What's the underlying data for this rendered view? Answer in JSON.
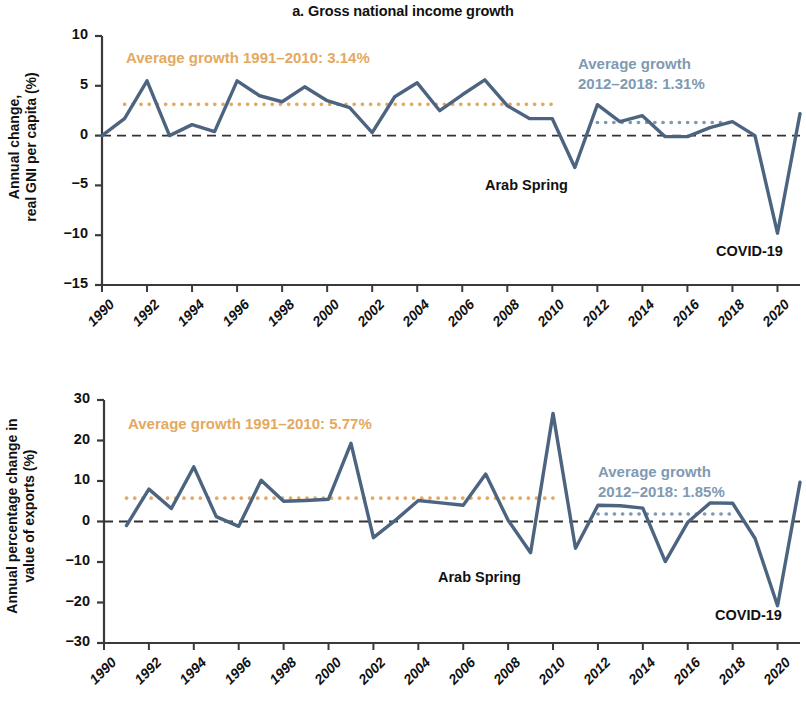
{
  "figure": {
    "background": "#ffffff",
    "series_color": "#4c6480",
    "orange_color": "#e5a860",
    "blue_color": "#7e9ab3",
    "zero_line_color": "#333333",
    "axis_color": "#3a3a3a"
  },
  "panel_a": {
    "title": "a. Gross national income growth",
    "ylabel_line1": "Annual change,",
    "ylabel_line2": "real GNI per capita (%)",
    "avg_note_orange": "Average growth 1991–2010: 3.14%",
    "avg_note_blue_line1": "Average growth",
    "avg_note_blue_line2": "2012–2018: 1.31%",
    "annotation_arab_spring": "Arab Spring",
    "annotation_covid": "COVID-19"
  },
  "panel_b": {
    "title": "b. Export growth",
    "ylabel_line1": "Annual percentage change in",
    "ylabel_line2": "value of exports (%)",
    "avg_note_orange": "Average growth 1991–2010: 5.77%",
    "avg_note_blue_line1": "Average growth",
    "avg_note_blue_line2": "2012–2018: 1.85%",
    "annotation_arab_spring": "Arab Spring",
    "annotation_covid": "COVID-19"
  },
  "chart_data": [
    {
      "type": "line",
      "id": "panel_a",
      "title": "a. Gross national income growth",
      "xlabel": "",
      "ylabel": "Annual change, real GNI per capita (%)",
      "xlim": [
        1990,
        2021
      ],
      "ylim": [
        -15,
        10
      ],
      "yticks": [
        10,
        5,
        0,
        -5,
        -10,
        -15
      ],
      "ytick_labels": [
        "10",
        "5",
        "0",
        "−5",
        "−10",
        "−15"
      ],
      "xticks": [
        1990,
        1992,
        1994,
        1996,
        1998,
        2000,
        2002,
        2004,
        2006,
        2008,
        2010,
        2012,
        2014,
        2016,
        2018,
        2020
      ],
      "xtick_labels": [
        "1990",
        "1992",
        "1994",
        "1996",
        "1998",
        "2000",
        "2002",
        "2004",
        "2006",
        "2008",
        "2010",
        "2012",
        "2014",
        "2016",
        "2018",
        "2020"
      ],
      "grid": false,
      "legend": "none",
      "x": [
        1990,
        1991,
        1992,
        1993,
        1994,
        1995,
        1996,
        1997,
        1998,
        1999,
        2000,
        2001,
        2002,
        2003,
        2004,
        2005,
        2006,
        2007,
        2008,
        2009,
        2010,
        2011,
        2012,
        2013,
        2014,
        2015,
        2016,
        2017,
        2018,
        2019,
        2020,
        2021
      ],
      "series": [
        {
          "name": "Annual change, real GNI per capita (%)",
          "color": "#4c6480",
          "values": [
            0.0,
            1.7,
            5.5,
            0.0,
            1.1,
            0.4,
            5.5,
            4.0,
            3.4,
            4.9,
            3.5,
            2.8,
            0.3,
            3.9,
            5.3,
            2.5,
            4.1,
            5.6,
            3.0,
            1.7,
            1.7,
            -3.2,
            3.1,
            1.4,
            2.0,
            -0.1,
            -0.1,
            0.8,
            1.4,
            0.0,
            -9.8,
            2.2
          ]
        }
      ],
      "reference_lines": [
        {
          "name": "Average growth 1991–2010",
          "value": 3.14,
          "label": "Average growth 1991–2010: 3.14%",
          "color": "#e5a860",
          "style": "dotted",
          "x_start": 1991,
          "x_end": 2010
        },
        {
          "name": "Average growth 2012–2018",
          "value": 1.31,
          "label": "Average growth 2012–2018: 1.31%",
          "color": "#7e9ab3",
          "style": "dotted",
          "x_start": 2012,
          "x_end": 2018
        },
        {
          "name": "zero",
          "value": 0,
          "label": "",
          "color": "#333333",
          "style": "dashed",
          "x_start": 1990,
          "x_end": 2021
        }
      ],
      "annotations": [
        {
          "text": "Arab Spring",
          "x": 2011,
          "y": -4.6
        },
        {
          "text": "COVID-19",
          "x": 2020,
          "y": -12.0
        }
      ]
    },
    {
      "type": "line",
      "id": "panel_b",
      "title": "b. Export growth",
      "xlabel": "",
      "ylabel": "Annual percentage change in value of exports (%)",
      "xlim": [
        1990,
        2021
      ],
      "ylim": [
        -30,
        30
      ],
      "yticks": [
        30,
        20,
        10,
        0,
        -10,
        -20,
        -30
      ],
      "ytick_labels": [
        "30",
        "20",
        "10",
        "0",
        "−10",
        "−20",
        "−30"
      ],
      "xticks": [
        1990,
        1992,
        1994,
        1996,
        1998,
        2000,
        2002,
        2004,
        2006,
        2008,
        2010,
        2012,
        2014,
        2016,
        2018,
        2020
      ],
      "xtick_labels": [
        "1990",
        "1992",
        "1994",
        "1996",
        "1998",
        "2000",
        "2002",
        "2004",
        "2006",
        "2008",
        "2010",
        "2012",
        "2014",
        "2016",
        "2018",
        "2020"
      ],
      "grid": false,
      "legend": "none",
      "x": [
        1991,
        1992,
        1993,
        1994,
        1995,
        1996,
        1997,
        1998,
        1999,
        2000,
        2001,
        2002,
        2003,
        2004,
        2005,
        2006,
        2007,
        2008,
        2009,
        2010,
        2011,
        2012,
        2013,
        2014,
        2015,
        2016,
        2017,
        2018,
        2019,
        2020,
        2021
      ],
      "series": [
        {
          "name": "Annual percentage change in value of exports (%)",
          "color": "#4c6480",
          "values": [
            -1.0,
            8.0,
            3.2,
            13.5,
            1.2,
            -1.2,
            10.2,
            5.0,
            5.2,
            5.5,
            19.3,
            -4.0,
            0.4,
            5.2,
            4.6,
            4.0,
            11.7,
            0.3,
            -7.7,
            26.7,
            -6.6,
            4.0,
            3.9,
            3.3,
            -9.9,
            -0.2,
            4.6,
            4.5,
            -4.2,
            -20.8,
            9.7
          ]
        }
      ],
      "reference_lines": [
        {
          "name": "Average growth 1991–2010",
          "value": 5.77,
          "label": "Average growth 1991–2010: 5.77%",
          "color": "#e5a860",
          "style": "dotted",
          "x_start": 1991,
          "x_end": 2010
        },
        {
          "name": "Average growth 2012–2018",
          "value": 1.85,
          "label": "Average growth 2012–2018: 1.85%",
          "color": "#7e9ab3",
          "style": "dotted",
          "x_start": 2012,
          "x_end": 2018
        },
        {
          "name": "zero",
          "value": 0,
          "label": "",
          "color": "#333333",
          "style": "dashed",
          "x_start": 1990,
          "x_end": 2021
        }
      ],
      "annotations": [
        {
          "text": "Arab Spring",
          "x": 2009,
          "y": -12.5
        },
        {
          "text": "COVID-19",
          "x": 2020,
          "y": -25.0
        }
      ]
    }
  ]
}
